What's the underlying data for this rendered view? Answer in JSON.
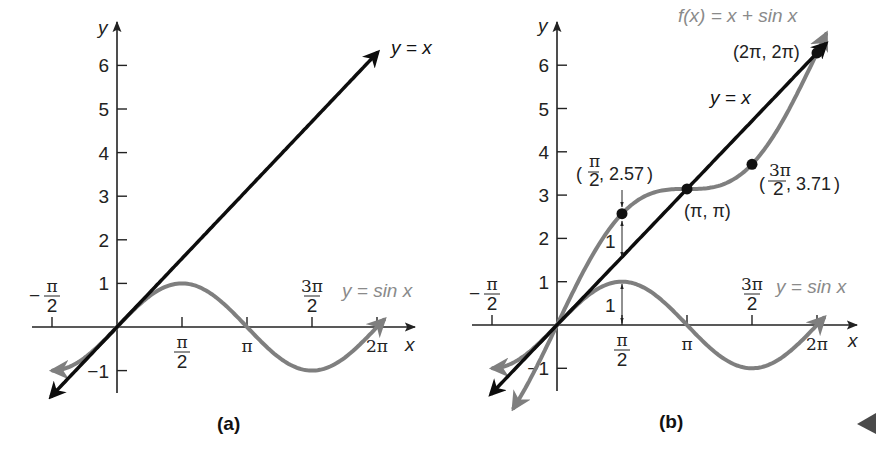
{
  "colors": {
    "axis": "#222222",
    "identity_line": "#0d0d0d",
    "sine_curve": "#7f7f7f",
    "sum_curve": "#7f7f7f",
    "gray_label": "#8a8a8a",
    "point": "#111111",
    "nav_arrow": "#4a4a4a"
  },
  "nav": {
    "icon": "back-triangle-icon"
  },
  "chart_data": [
    {
      "panel": "a",
      "caption": "(a)",
      "type": "line",
      "xlabel": "x",
      "ylabel": "y",
      "xlim": [
        -1.7,
        6.9
      ],
      "ylim": [
        -1.6,
        6.9
      ],
      "grid": false,
      "x_ticks": [
        {
          "value": -1.5708,
          "label": "−π/2",
          "num": "π",
          "den": "2",
          "neg": true,
          "pos": "above"
        },
        {
          "value": 1.5708,
          "label": "π/2",
          "num": "π",
          "den": "2",
          "pos": "below"
        },
        {
          "value": 3.1416,
          "label": "π",
          "pos": "below"
        },
        {
          "value": 4.7124,
          "label": "3π/2",
          "num": "3π",
          "den": "2",
          "pos": "above"
        },
        {
          "value": 6.2832,
          "label": "2π",
          "pos": "below"
        }
      ],
      "y_ticks": [
        -1,
        1,
        2,
        3,
        4,
        5,
        6
      ],
      "y_tick_labels": [
        "−1",
        "1",
        "2",
        "3",
        "4",
        "5",
        "6"
      ],
      "series": [
        {
          "name": "y = x",
          "function": "x",
          "x_range": [
            -1.6,
            6.3
          ],
          "color": "identity_line",
          "label_pos": "top-right"
        },
        {
          "name": "y = sin x",
          "function": "sin(x)",
          "x_range": [
            -1.55,
            6.45
          ],
          "color": "sine_curve",
          "label_pos": "right of 3π/2"
        }
      ],
      "annotations": []
    },
    {
      "panel": "b",
      "caption": "(b)",
      "type": "line",
      "xlabel": "x",
      "ylabel": "y",
      "xlim": [
        -1.7,
        6.9
      ],
      "ylim": [
        -1.6,
        6.9
      ],
      "grid": false,
      "x_ticks": [
        {
          "value": -1.5708,
          "label": "−π/2",
          "num": "π",
          "den": "2",
          "neg": true,
          "pos": "above"
        },
        {
          "value": 1.5708,
          "label": "π/2",
          "num": "π",
          "den": "2",
          "pos": "below"
        },
        {
          "value": 3.1416,
          "label": "π",
          "pos": "below"
        },
        {
          "value": 4.7124,
          "label": "3π/2",
          "num": "3π",
          "den": "2",
          "pos": "above"
        },
        {
          "value": 6.2832,
          "label": "2π",
          "pos": "below"
        }
      ],
      "y_ticks": [
        -1,
        1,
        2,
        3,
        4,
        5,
        6
      ],
      "y_tick_labels": [
        "−1",
        "1",
        "2",
        "3",
        "4",
        "5",
        "6"
      ],
      "series": [
        {
          "name": "y = x",
          "function": "x",
          "x_range": [
            -1.6,
            6.5
          ],
          "color": "identity_line"
        },
        {
          "name": "y = sin x",
          "function": "sin(x)",
          "x_range": [
            -1.55,
            6.45
          ],
          "color": "sine_curve"
        },
        {
          "name": "f(x) = x + sin x",
          "function": "x + sin(x)",
          "x_range": [
            -1.05,
            6.5
          ],
          "color": "sum_curve"
        }
      ],
      "points": [
        {
          "x": 1.5708,
          "y": 2.57,
          "label": "(π/2, 2.57)"
        },
        {
          "x": 3.1416,
          "y": 3.1416,
          "label": "(π, π)"
        },
        {
          "x": 4.7124,
          "y": 3.71,
          "label": "(3π/2, 3.71)"
        },
        {
          "x": 6.2832,
          "y": 6.2832,
          "label": "(2π, 2π)"
        }
      ],
      "annotations": [
        {
          "text": "1",
          "note": "vertical distance from y=x to f(x) at x=π/2"
        },
        {
          "text": "1",
          "note": "vertical distance from x-axis to sin x at x=π/2"
        }
      ]
    }
  ],
  "labels": {
    "a": {
      "y_axis": "y",
      "x_axis": "x",
      "line": "y = x",
      "sine": "y = sin x",
      "caption": "(a)",
      "pi": "π",
      "two_pi": "2π",
      "pi_num": "π",
      "three_pi_num": "3π",
      "den": "2",
      "minus": "−"
    },
    "b": {
      "y_axis": "y",
      "x_axis": "x",
      "line": "y = x",
      "sine": "y = sin x",
      "sum": "f(x) = x + sin x",
      "caption": "(b)",
      "pt1_num": "π",
      "pt1_den": "2",
      "pt1_val": ", 2.57",
      "pt2": "(π, π)",
      "pt3_num": "3π",
      "pt3_den": "2",
      "pt3_val": ", 3.71",
      "pt4": "(2π, 2π)",
      "one": "1",
      "pi": "π",
      "two_pi": "2π",
      "pi_num": "π",
      "three_pi_num": "3π",
      "den": "2",
      "minus": "−"
    }
  }
}
